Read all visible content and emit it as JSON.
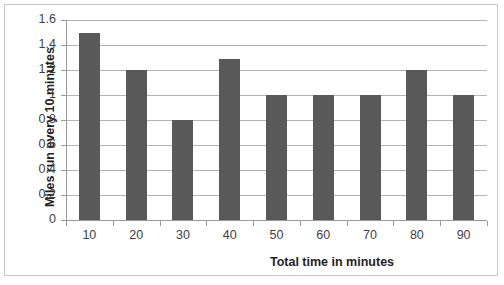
{
  "chart_data": {
    "type": "bar",
    "title": "",
    "xlabel": "Total time in minutes",
    "ylabel": "Miles run every 10 minutes",
    "categories": [
      "10",
      "20",
      "30",
      "40",
      "50",
      "60",
      "70",
      "80",
      "90"
    ],
    "values": [
      1.5,
      1.2,
      0.8,
      1.29,
      1.0,
      1.0,
      1.0,
      1.2,
      1.0
    ],
    "ylim": [
      0,
      1.6
    ],
    "ytick_labels": [
      "0",
      "0.2",
      "0.4",
      "0.6",
      "0.8",
      "1",
      "1.2",
      "1.4",
      "1.6"
    ],
    "ytick_values": [
      0,
      0.2,
      0.4,
      0.6,
      0.8,
      1,
      1.2,
      1.4,
      1.6
    ],
    "grid": "horizontal",
    "legend": "none",
    "series": [
      {
        "name": "Miles run every 10 minutes",
        "values": [
          1.5,
          1.2,
          0.8,
          1.29,
          1.0,
          1.0,
          1.0,
          1.2,
          1.0
        ]
      }
    ],
    "colors": {
      "bar": "#595959",
      "gridline": "#b3b3b3",
      "axis": "#9a9a9a",
      "frame": "#c9c9c9",
      "text": "#3f3f3f",
      "title_text": "#1f1f1f",
      "background": "#ffffff"
    }
  }
}
